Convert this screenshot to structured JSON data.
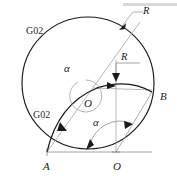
{
  "figure": {
    "background_color": "#ffffff",
    "line_color": "#1a1a1a",
    "thin_line_color": "#8a8a8a",
    "labels": {
      "g02_upper": "G02",
      "g02_lower": "G02",
      "point_a": "A",
      "point_o_lower": "O",
      "point_o_center": "O",
      "point_b": "B",
      "radius_outer": "R",
      "radius_inner": "R",
      "angle_upper": "α",
      "angle_lower": "α"
    },
    "geometry": {
      "big_circle": {
        "cx": 88,
        "cy": 83,
        "r": 66
      },
      "inner_arc": {
        "cx": 47,
        "cy": 152,
        "r": 108
      },
      "point_a": {
        "x": 47,
        "y": 152
      },
      "point_o_bottom": {
        "x": 116,
        "y": 152
      },
      "point_b": {
        "x": 152,
        "y": 92
      },
      "point_o_center": {
        "x": 88,
        "y": 96
      },
      "angle_upper_arc_r": 16,
      "angle_lower_arc_r": 31
    }
  }
}
